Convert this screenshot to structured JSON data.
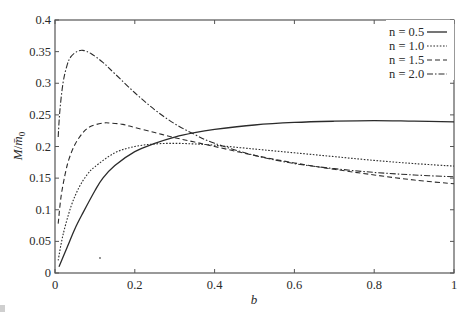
{
  "chart_data": {
    "type": "line",
    "title": "",
    "xlabel": "b",
    "ylabel": "M/m̄₀",
    "xlim": [
      0,
      1
    ],
    "ylim": [
      0,
      0.4
    ],
    "xticks": [
      0,
      0.2,
      0.4,
      0.6,
      0.8,
      1
    ],
    "xtick_labels": [
      "0",
      "0.2",
      "0.4",
      "0.6",
      "0.8",
      "1"
    ],
    "yticks": [
      0,
      0.05,
      0.1,
      0.15,
      0.2,
      0.25,
      0.3,
      0.35,
      0.4
    ],
    "ytick_labels": [
      "0",
      "0.05",
      "0.1",
      "0.15",
      "0.2",
      "0.25",
      "0.3",
      "0.35",
      "0.4"
    ],
    "grid": false,
    "legend_position": "upper right",
    "series": [
      {
        "name": "n = 0.5",
        "style": "solid",
        "x": [
          0.01,
          0.03,
          0.05,
          0.07,
          0.1,
          0.12,
          0.15,
          0.2,
          0.25,
          0.3,
          0.35,
          0.4,
          0.5,
          0.6,
          0.7,
          0.8,
          0.9,
          1.0
        ],
        "y": [
          0.01,
          0.04,
          0.07,
          0.095,
          0.13,
          0.15,
          0.17,
          0.192,
          0.205,
          0.215,
          0.222,
          0.227,
          0.234,
          0.238,
          0.24,
          0.241,
          0.24,
          0.239
        ]
      },
      {
        "name": "n = 1.0",
        "style": "dotted",
        "x": [
          0.008,
          0.02,
          0.04,
          0.06,
          0.08,
          0.1,
          0.15,
          0.2,
          0.25,
          0.3,
          0.35,
          0.4,
          0.5,
          0.6,
          0.7,
          0.8,
          0.9,
          1.0
        ],
        "y": [
          0.02,
          0.06,
          0.105,
          0.135,
          0.155,
          0.168,
          0.19,
          0.2,
          0.204,
          0.205,
          0.204,
          0.202,
          0.196,
          0.19,
          0.184,
          0.178,
          0.173,
          0.169
        ]
      },
      {
        "name": "n = 1.5",
        "style": "dashed",
        "x": [
          0.008,
          0.015,
          0.025,
          0.035,
          0.05,
          0.07,
          0.09,
          0.12,
          0.14,
          0.17,
          0.2,
          0.25,
          0.3,
          0.35,
          0.4,
          0.5,
          0.6,
          0.7,
          0.8,
          0.9,
          1.0
        ],
        "y": [
          0.078,
          0.12,
          0.155,
          0.18,
          0.203,
          0.222,
          0.232,
          0.237,
          0.237,
          0.235,
          0.23,
          0.222,
          0.214,
          0.207,
          0.2,
          0.186,
          0.174,
          0.164,
          0.155,
          0.147,
          0.141
        ]
      },
      {
        "name": "n = 2.0",
        "style": "dash-dot",
        "x": [
          0.008,
          0.012,
          0.02,
          0.03,
          0.04,
          0.055,
          0.07,
          0.09,
          0.12,
          0.15,
          0.2,
          0.25,
          0.3,
          0.35,
          0.4,
          0.5,
          0.6,
          0.7,
          0.8,
          0.9,
          1.0
        ],
        "y": [
          0.215,
          0.255,
          0.3,
          0.328,
          0.342,
          0.35,
          0.352,
          0.347,
          0.333,
          0.315,
          0.285,
          0.258,
          0.236,
          0.219,
          0.205,
          0.186,
          0.173,
          0.165,
          0.159,
          0.155,
          0.152
        ]
      }
    ]
  },
  "legend": {
    "items": [
      {
        "label": "n = 0.5",
        "style": "solid"
      },
      {
        "label": "n = 1.0",
        "style": "dotted"
      },
      {
        "label": "n = 1.5",
        "style": "dashed"
      },
      {
        "label": "n = 2.0",
        "style": "dash-dot"
      }
    ]
  },
  "axes": {
    "xlabel": "b",
    "ylabel_main": "M",
    "ylabel_sep": "/",
    "ylabel_den": "m̄",
    "ylabel_sub": "0"
  },
  "colors": {
    "line": "#2b2b2b",
    "axis": "#555555",
    "background": "#ffffff"
  }
}
